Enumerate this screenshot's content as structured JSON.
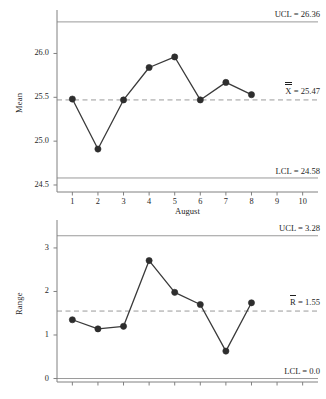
{
  "chart_data": [
    {
      "type": "line",
      "id": "xbar-chart",
      "title": "",
      "xlabel": "August",
      "ylabel": "Mean",
      "categories": [
        "1",
        "2",
        "3",
        "4",
        "5",
        "6",
        "7",
        "8",
        "9",
        "10"
      ],
      "x": [
        1,
        2,
        3,
        4,
        5,
        6,
        7,
        8
      ],
      "values": [
        25.48,
        24.91,
        25.47,
        25.84,
        25.96,
        25.47,
        25.67,
        25.53
      ],
      "xlim": [
        0.4,
        10.6
      ],
      "ylim": [
        24.42,
        26.45
      ],
      "yticks": [
        24.5,
        25.0,
        25.5,
        26.0
      ],
      "ytick_labels": [
        "24.5",
        "25.0",
        "25.5",
        "26.0"
      ],
      "xticks": [
        1,
        2,
        3,
        4,
        5,
        6,
        7,
        8,
        9,
        10
      ],
      "grid": false,
      "legend": "none",
      "control_limits": {
        "ucl_value": 26.36,
        "ucl_label": "UCL = 26.36",
        "center_value": 25.47,
        "center_label": "= 25.47",
        "center_symbol": "X",
        "center_symbol_bars": 2,
        "lcl_value": 24.58,
        "lcl_label": "LCL = 24.58"
      },
      "marker": "filled-circle",
      "line_color": "#3a3a3a",
      "marker_color": "#2e2e2e",
      "limit_line_color": "#9a9a9a",
      "center_line_color": "#9a9a9a",
      "center_line_style": "dashed"
    },
    {
      "type": "line",
      "id": "range-chart",
      "title": "",
      "xlabel": "",
      "ylabel": "Range",
      "categories": [
        "1",
        "2",
        "3",
        "4",
        "5",
        "6",
        "7",
        "8",
        "9",
        "10"
      ],
      "x": [
        1,
        2,
        3,
        4,
        5,
        6,
        7,
        8
      ],
      "values": [
        1.35,
        1.14,
        1.2,
        2.71,
        1.98,
        1.7,
        0.63,
        1.74
      ],
      "xlim": [
        0.4,
        10.6
      ],
      "ylim": [
        -0.08,
        3.55
      ],
      "yticks": [
        0,
        1,
        2,
        3
      ],
      "ytick_labels": [
        "0",
        "1",
        "2",
        "3"
      ],
      "xticks": [
        1,
        2,
        3,
        4,
        5,
        6,
        7,
        8,
        9,
        10
      ],
      "grid": false,
      "legend": "none",
      "control_limits": {
        "ucl_value": 3.28,
        "ucl_label": "UCL = 3.28",
        "center_value": 1.55,
        "center_label": "= 1.55",
        "center_symbol": "R",
        "center_symbol_bars": 1,
        "lcl_value": 0.0,
        "lcl_label": "LCL = 0.0"
      },
      "marker": "filled-circle",
      "line_color": "#3a3a3a",
      "marker_color": "#2e2e2e",
      "limit_line_color": "#9a9a9a",
      "center_line_color": "#9a9a9a",
      "center_line_style": "dashed"
    }
  ],
  "xbar": {
    "ylabel": "Mean",
    "xlabel": "August",
    "ytick_labels": [
      "26.0",
      "25.5",
      "25.0",
      "24.5"
    ],
    "xtick_labels": [
      "1",
      "2",
      "3",
      "4",
      "5",
      "6",
      "7",
      "8",
      "9",
      "10"
    ],
    "ucl_label": "UCL = 26.36",
    "center_label": "= 25.47",
    "center_symbol": "X",
    "lcl_label": "LCL = 24.58"
  },
  "range": {
    "ylabel": "Range",
    "ytick_labels": [
      "3",
      "2",
      "1",
      "0"
    ],
    "ucl_label": "UCL = 3.28",
    "center_label": "= 1.55",
    "center_symbol": "R",
    "lcl_label": "LCL = 0.0"
  },
  "colors": {
    "series_line": "#3a3a3a",
    "marker": "#2e2e2e",
    "limit_line": "#9a9a9a",
    "center_line": "#9a9a9a",
    "axis": "#808080",
    "text": "#1f1f1f"
  }
}
